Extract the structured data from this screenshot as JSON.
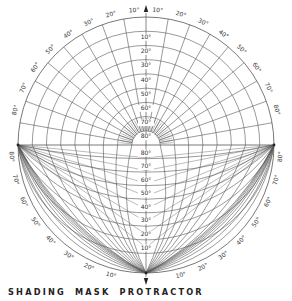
{
  "title": "SHADING MASK PROTRACTOR",
  "colors": {
    "line": "#555555",
    "text": "#333333",
    "background": "#ffffff"
  },
  "geometry": {
    "cx": 146,
    "cy": 145,
    "r": 128
  },
  "upper_half": {
    "description": "Polar altitude grid (horizontal shadow angles)",
    "altitude_labels": [
      "10°",
      "20°",
      "30°",
      "40°",
      "50°",
      "60°",
      "70°",
      "80°"
    ],
    "rim_labels_left": [
      "10°",
      "20°",
      "30°",
      "40°",
      "50°",
      "60°",
      "70°",
      "80°"
    ],
    "rim_labels_right": [
      "10°",
      "20°",
      "30°",
      "40°",
      "50°",
      "60°",
      "70°",
      "80°"
    ]
  },
  "lower_half": {
    "description": "Vertical shadow angle curves",
    "center_labels": [
      "80°",
      "70°",
      "60°",
      "50°",
      "40°",
      "30°",
      "20°",
      "10°"
    ],
    "rim_labels_left": [
      "80°",
      "70°",
      "60°",
      "50°",
      "40°",
      "30°",
      "20°",
      "10°"
    ],
    "rim_labels_right": [
      "80°",
      "70°",
      "60°",
      "50°",
      "40°",
      "30°",
      "20°",
      "10°"
    ]
  },
  "arrows": {
    "top": "north-arrow",
    "bottom": "south-arrow"
  }
}
